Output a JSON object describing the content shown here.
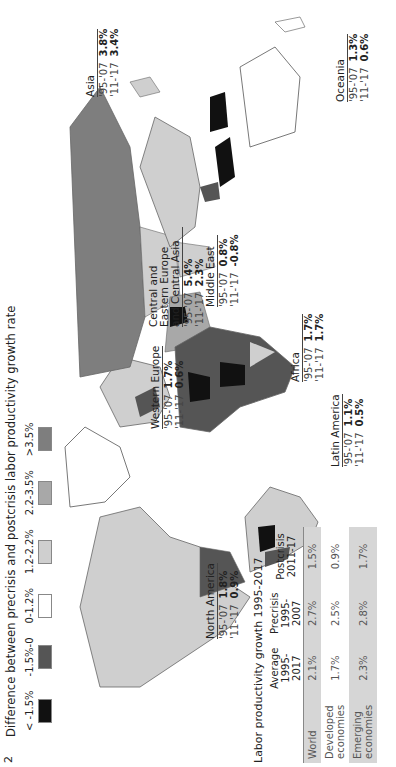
{
  "page_number": "2",
  "legend": {
    "title": "Difference between precrisis and postcrisis labor productivity growth rate",
    "items": [
      {
        "label": "< -1.5%",
        "color": "#111111"
      },
      {
        "label": "-1.5%-0",
        "color": "#555555"
      },
      {
        "label": "0-1.2%",
        "color": "#ffffff"
      },
      {
        "label": "1.2-2.2%",
        "color": "#cfcfcf"
      },
      {
        "label": "2.2-3.5%",
        "color": "#a8a8a8"
      },
      {
        "label": ">3.5%",
        "color": "#7e7e7e"
      }
    ]
  },
  "regions": [
    {
      "name": "North America",
      "pre_label": "'95-'07",
      "pre": "1.8%",
      "post_label": "'11-'17",
      "post": "0.9%"
    },
    {
      "name": "Western Europe",
      "pre_label": "'95-'07",
      "pre": "1.7%",
      "post_label": "'11-'17",
      "post": "0.6%"
    },
    {
      "name": "Central and Eastern Europe and Central Asia",
      "pre_label": "'95-'07",
      "pre": "5.4%",
      "post_label": "'11-'17",
      "post": "2.3%"
    },
    {
      "name": "Middle East",
      "pre_label": "'95-'07",
      "pre": "0.8%",
      "post_label": "'11-'17",
      "post": "-0.8%"
    },
    {
      "name": "Africa",
      "pre_label": "'95-'07",
      "pre": "1.7%",
      "post_label": "'11-'17",
      "post": "1.7%"
    },
    {
      "name": "Latin America",
      "pre_label": "'95-'07",
      "pre": "1.1%",
      "post_label": "'11-'17",
      "post": "0.5%"
    },
    {
      "name": "Asia",
      "pre_label": "'95-'07",
      "pre": "3.8%",
      "post_label": "'11-'17",
      "post": "3.4%"
    },
    {
      "name": "Oceania",
      "pre_label": "'95-'07",
      "pre": "1.3%",
      "post_label": "'11-'17",
      "post": "0.6%"
    }
  ],
  "table": {
    "title": "Labor productivity growth 1995-2017",
    "headers": [
      "",
      "Average 1995-2017",
      "Precrisis 1995-2007",
      "Postcrisis 2011-17"
    ],
    "rows": [
      {
        "label": "World",
        "values": [
          "2.1%",
          "2.7%",
          "1.5%"
        ]
      },
      {
        "label": "Developed economies",
        "values": [
          "1.7%",
          "2.5%",
          "0.9%"
        ]
      },
      {
        "label": "Emerging economies",
        "values": [
          "2.3%",
          "2.8%",
          "1.7%"
        ]
      }
    ]
  }
}
